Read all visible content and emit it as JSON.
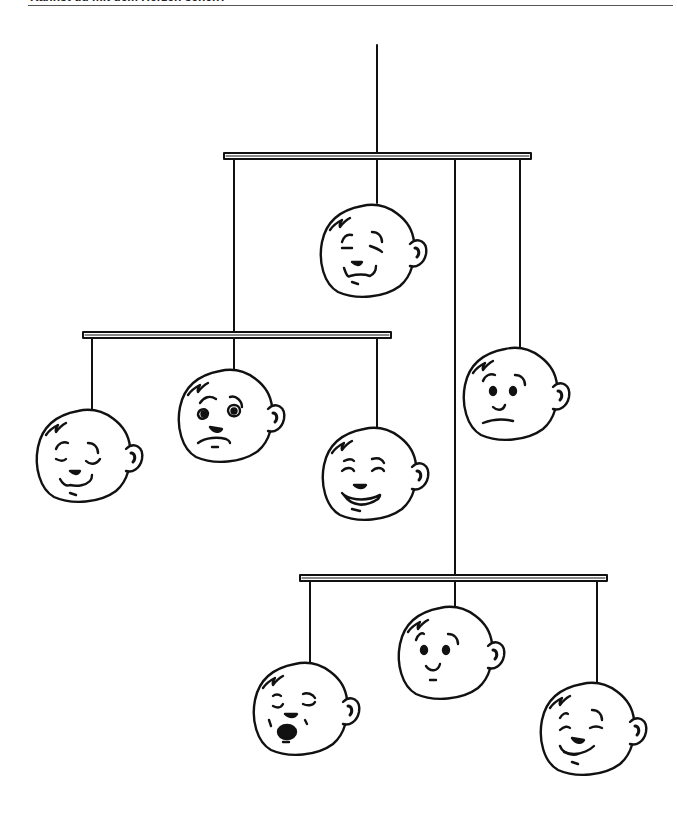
{
  "header": {
    "title": "Kannst du mit dem Herzen sehen?"
  },
  "illustration": {
    "description": "Baby mobile with eight hanging cartoon faces showing different emotions",
    "stroke_color": "#111111",
    "bars": [
      {
        "name": "top-bar",
        "x1": 224,
        "x2": 531,
        "y": 153
      },
      {
        "name": "middle-bar",
        "x1": 83,
        "x2": 391,
        "y": 332
      },
      {
        "name": "lower-bar",
        "x1": 300,
        "x2": 607,
        "y": 575
      }
    ],
    "faces": [
      {
        "name": "content-face",
        "expression": "content"
      },
      {
        "name": "sleepy-smile-face",
        "expression": "sleepy-smile"
      },
      {
        "name": "worried-face",
        "expression": "worried"
      },
      {
        "name": "laughing-face",
        "expression": "laughing"
      },
      {
        "name": "neutral-face",
        "expression": "neutral"
      },
      {
        "name": "yawning-face",
        "expression": "yawning"
      },
      {
        "name": "curious-face",
        "expression": "curious"
      },
      {
        "name": "smirking-face",
        "expression": "smirking"
      }
    ]
  }
}
